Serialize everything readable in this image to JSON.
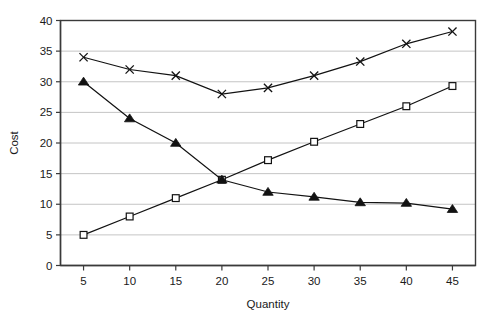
{
  "chart_data": {
    "type": "line",
    "title": "",
    "xlabel": "Quantity",
    "ylabel": "Cost",
    "x": [
      5,
      10,
      15,
      20,
      25,
      30,
      35,
      40,
      45
    ],
    "xticks": [
      "5",
      "10",
      "15",
      "20",
      "25",
      "30",
      "35",
      "40",
      "45"
    ],
    "yticks": [
      "0",
      "5",
      "10",
      "15",
      "20",
      "25",
      "30",
      "35",
      "40"
    ],
    "xlim": [
      2.5,
      47.5
    ],
    "ylim": [
      0,
      40
    ],
    "grid": "horizontal",
    "legend": "none",
    "series": [
      {
        "name": "cross-series",
        "marker": "cross",
        "values": [
          34,
          32,
          31,
          28,
          29,
          31,
          33.3,
          36.2,
          38.2
        ]
      },
      {
        "name": "square-series",
        "marker": "open-square",
        "values": [
          5,
          8,
          11,
          14,
          17.2,
          20.2,
          23.1,
          26,
          29.3
        ]
      },
      {
        "name": "triangle-series",
        "marker": "filled-triangle",
        "values": [
          30,
          24,
          20,
          14,
          12,
          11.2,
          10.3,
          10.2,
          9.2
        ]
      }
    ]
  }
}
